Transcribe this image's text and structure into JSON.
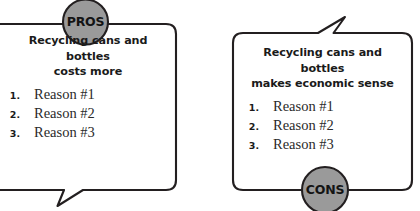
{
  "diagram": {
    "type": "pros-and-cons-speech-bubbles",
    "stroke_color": "#231f20",
    "badge_fill": "#9a9a9a",
    "badge_stroke": "#231f20",
    "text_color": "#1a1a1a",
    "background": "#ffffff"
  },
  "panels": [
    {
      "id": "pros",
      "badge_label": "PROS",
      "badge_position": "top",
      "tail_direction": "down-left",
      "heading_line1": "Recycling cans and bottles",
      "heading_line2": "costs more",
      "reasons": [
        {
          "number": "1.",
          "label": "Reason #1"
        },
        {
          "number": "2.",
          "label": "Reason #2"
        },
        {
          "number": "3.",
          "label": "Reason #3"
        }
      ]
    },
    {
      "id": "cons",
      "badge_label": "CONS",
      "badge_position": "bottom",
      "tail_direction": "up-right",
      "heading_line1": "Recycling cans and bottles",
      "heading_line2": "makes economic sense",
      "reasons": [
        {
          "number": "1.",
          "label": "Reason #1"
        },
        {
          "number": "2.",
          "label": "Reason #2"
        },
        {
          "number": "3.",
          "label": "Reason #3"
        }
      ]
    }
  ]
}
